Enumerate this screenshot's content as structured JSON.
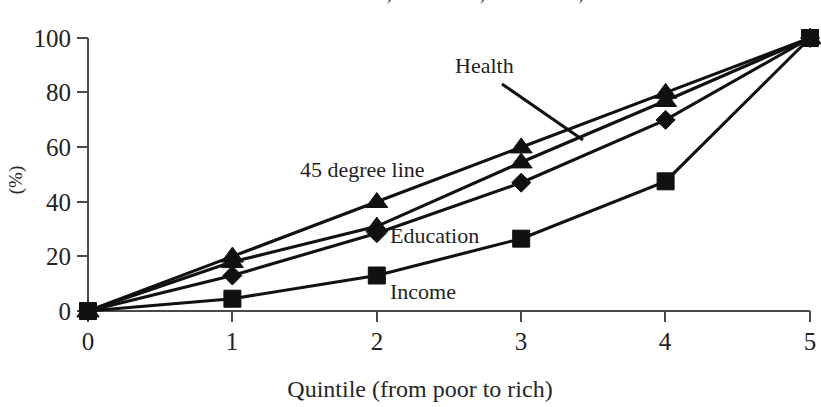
{
  "chart_data": {
    "type": "line",
    "title": "Distribution of income, education, and health, Peru",
    "xlabel": "Quintile (from poor to rich)",
    "ylabel": "(%)",
    "xlim": [
      0,
      5
    ],
    "ylim": [
      0,
      100
    ],
    "x": [
      0,
      1,
      2,
      3,
      4,
      5
    ],
    "xticks": [
      "0",
      "1",
      "2",
      "3",
      "4",
      "5"
    ],
    "yticks": [
      "0",
      "20",
      "40",
      "60",
      "80",
      "100"
    ],
    "grid": false,
    "legend_position": "inline-annotations",
    "series": [
      {
        "name": "Health",
        "marker": "triangle",
        "values": [
          0,
          20,
          40,
          60,
          80,
          100
        ]
      },
      {
        "name": "45 degree line",
        "marker": "triangle",
        "values": [
          0,
          18,
          31,
          54.5,
          77,
          100
        ]
      },
      {
        "name": "Education",
        "marker": "diamond",
        "values": [
          0,
          13,
          28.5,
          47,
          70,
          100
        ]
      },
      {
        "name": "Income",
        "marker": "square",
        "values": [
          0,
          4.5,
          13,
          26.5,
          47.5,
          100
        ]
      }
    ],
    "annotations": [
      {
        "text": "Health",
        "x": 455,
        "y": 73,
        "leader": true
      },
      {
        "text": "45 degree line",
        "x": 300,
        "y": 177,
        "leader": false
      },
      {
        "text": "Education",
        "x": 390,
        "y": 243,
        "leader": false
      },
      {
        "text": "Income",
        "x": 390,
        "y": 299,
        "leader": false
      }
    ]
  },
  "axis": {
    "y_tick_0": "0",
    "y_tick_20": "20",
    "y_tick_40": "40",
    "y_tick_60": "60",
    "y_tick_80": "80",
    "y_tick_100": "100",
    "x_tick_0": "0",
    "x_tick_1": "1",
    "x_tick_2": "2",
    "x_tick_3": "3",
    "x_tick_4": "4",
    "x_tick_5": "5",
    "x_title": "Quintile (from poor to rich)",
    "y_title": "(%)"
  },
  "annotations": {
    "health": "Health",
    "forty_five_degree_line": "45 degree line",
    "education": "Education",
    "income": "Income"
  },
  "colors": {
    "ink": "#111111",
    "axis": "#4a4a4a",
    "background": "#ffffff"
  }
}
